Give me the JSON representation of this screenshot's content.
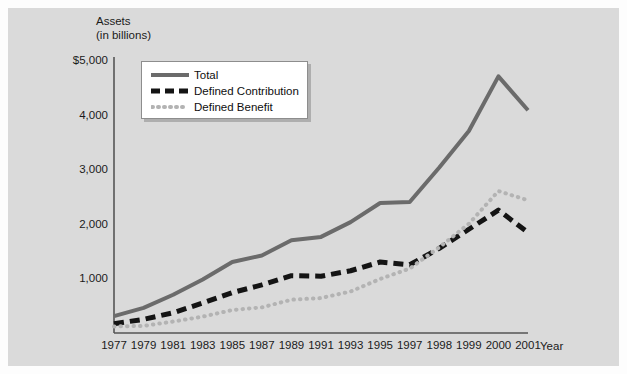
{
  "chart_data": {
    "type": "line",
    "title": "",
    "subtitle": "",
    "xlabel": "Year",
    "ylabel": "Assets\n(in billions)",
    "ylabel_line1": "Assets",
    "ylabel_line2": "(in billions)",
    "grid": false,
    "legend_position": "top-left",
    "x": [
      1977,
      1979,
      1981,
      1983,
      1985,
      1987,
      1989,
      1991,
      1993,
      1995,
      1997,
      1998,
      1999,
      2000,
      2001
    ],
    "x_tick_labels": [
      "1977",
      "1979",
      "1981",
      "1983",
      "1985",
      "1987",
      "1989",
      "1991",
      "1993",
      "1995",
      "1997",
      "1998",
      "1999",
      "2000",
      "2001"
    ],
    "y_tick_labels": [
      "1,000",
      "2,000",
      "3,000",
      "4,000",
      "$5,000"
    ],
    "y_tick_values": [
      1000,
      2000,
      3000,
      4000,
      5000
    ],
    "ylim": [
      0,
      5400
    ],
    "xlim_index": [
      0,
      14
    ],
    "series": [
      {
        "name": "Total",
        "style": "solid",
        "color": "#6b6b6b",
        "values": [
          310,
          460,
          700,
          980,
          1300,
          1420,
          1700,
          1760,
          2030,
          2380,
          2400,
          3030,
          3700,
          4700,
          4080
        ]
      },
      {
        "name": "Defined Contribution",
        "style": "dashed",
        "color": "#141414",
        "values": [
          170,
          250,
          370,
          550,
          740,
          880,
          1050,
          1040,
          1140,
          1300,
          1250,
          1550,
          1900,
          2250,
          1840
        ]
      },
      {
        "name": "Defined Benefit",
        "style": "dotted",
        "color": "#b3b3b3",
        "values": [
          120,
          130,
          210,
          300,
          420,
          470,
          610,
          640,
          760,
          990,
          1180,
          1570,
          2000,
          2600,
          2430
        ]
      }
    ]
  },
  "legend": {
    "items": [
      {
        "label": "Total",
        "icon": "solid-line-swatch"
      },
      {
        "label": "Defined Contribution",
        "icon": "dashed-line-swatch"
      },
      {
        "label": "Defined Benefit",
        "icon": "dotted-line-swatch"
      }
    ]
  },
  "colors": {
    "panel_background": "#dadada",
    "figure_background": "#fdfdfd",
    "axis": "#555555",
    "total": "#6b6b6b",
    "defined_contribution": "#141414",
    "defined_benefit": "#b3b3b3",
    "text": "#1a1a1a"
  }
}
